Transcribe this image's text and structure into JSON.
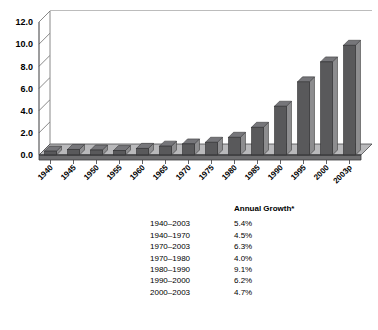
{
  "chart_data": {
    "type": "bar",
    "title": "",
    "xlabel": "",
    "ylabel": "",
    "ylim": [
      0.0,
      12.0
    ],
    "ytick_step": 2.0,
    "grid": true,
    "legend": "none",
    "style": "3d-column",
    "bar_color": "#59595b",
    "bar_side_color": "#8d8d8f",
    "bar_top_color": "#76767a",
    "categories": [
      "1940",
      "1945",
      "1950",
      "1955",
      "1960",
      "1965",
      "1970",
      "1975",
      "1980",
      "1985",
      "1990",
      "1995",
      "2000",
      "2003p"
    ],
    "values": [
      0.35,
      0.5,
      0.45,
      0.4,
      0.6,
      0.8,
      1.0,
      1.15,
      1.6,
      2.5,
      4.4,
      6.6,
      8.4,
      9.9
    ],
    "ytick_labels": [
      "0.0",
      "2.0",
      "4.0",
      "6.0",
      "8.0",
      "10.0",
      "12.0"
    ],
    "ytick_values": [
      0.0,
      2.0,
      4.0,
      6.0,
      8.0,
      10.0,
      12.0
    ]
  },
  "table": {
    "header_period": "",
    "header_value": "Annual Growth*",
    "rows": [
      {
        "period": "1940–2003",
        "value": "5.4%"
      },
      {
        "period": "1940–1970",
        "value": "4.5%"
      },
      {
        "period": "1970–2003",
        "value": "6.3%"
      },
      {
        "period": "1970–1980",
        "value": "4.0%"
      },
      {
        "period": "1980–1990",
        "value": "9.1%"
      },
      {
        "period": "1990–2000",
        "value": "6.2%"
      },
      {
        "period": "2000–2003",
        "value": "4.7%"
      }
    ]
  }
}
